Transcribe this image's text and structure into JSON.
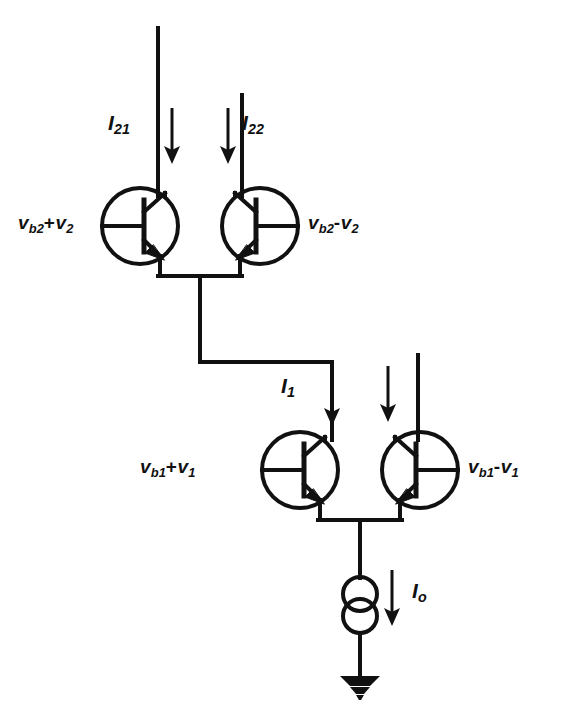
{
  "figure": {
    "kind": "circuit-schematic",
    "background_color": "#ffffff",
    "line_color": "#111111"
  },
  "labels": {
    "upper_left_base": {
      "main": "v",
      "sub": "b2",
      "op": "+",
      "term": "v",
      "term_sub": "2"
    },
    "upper_right_base": {
      "main": "v",
      "sub": "b2",
      "op": "-",
      "term": "v",
      "term_sub": "2"
    },
    "lower_left_base": {
      "main": "v",
      "sub": "b1",
      "op": "+",
      "term": "v",
      "term_sub": "1"
    },
    "lower_right_base": {
      "main": "v",
      "sub": "b1",
      "op": "-",
      "term": "v",
      "term_sub": "1"
    },
    "current_upper_left": {
      "main": "I",
      "sub": "21"
    },
    "current_upper_right": {
      "main": "I",
      "sub": "22"
    },
    "current_mid_left": {
      "main": "I",
      "sub": "1"
    },
    "current_tail": {
      "main": "I",
      "sub": "o"
    }
  },
  "components": {
    "transistors": [
      {
        "name": "Q21",
        "type": "npn",
        "orientation": "base-left",
        "cx": 140,
        "cy": 226
      },
      {
        "name": "Q22",
        "type": "npn",
        "orientation": "base-right",
        "cx": 260,
        "cy": 226
      },
      {
        "name": "Q11",
        "type": "npn",
        "orientation": "base-left",
        "cx": 300,
        "cy": 470
      },
      {
        "name": "Q12",
        "type": "npn",
        "orientation": "base-right",
        "cx": 420,
        "cy": 470
      }
    ],
    "current_source": {
      "name": "Io",
      "cx": 360,
      "cy": 600,
      "style": "double-circle"
    },
    "ground": {
      "name": "gnd",
      "x": 360,
      "y": 680,
      "style": "filled-triangle"
    }
  },
  "current_arrows": [
    {
      "name": "I21-arrow",
      "x": 172,
      "y_from": 108,
      "y_to": 160,
      "labeled": true
    },
    {
      "name": "I22-arrow",
      "x": 228,
      "y_from": 108,
      "y_to": 160,
      "labeled": true
    },
    {
      "name": "I1-arrow",
      "x": 332,
      "y_from": 368,
      "y_to": 420,
      "labeled": true
    },
    {
      "name": "Ic12-arrow",
      "x": 388,
      "y_from": 368,
      "y_to": 420,
      "labeled": false
    },
    {
      "name": "Io-arrow",
      "x": 392,
      "y_from": 570,
      "y_to": 625,
      "labeled": true
    }
  ]
}
